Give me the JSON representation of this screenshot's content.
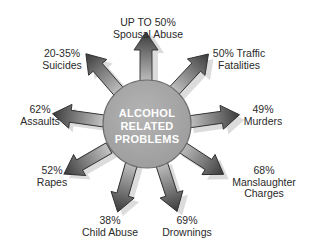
{
  "diagram": {
    "center": {
      "lines": [
        "ALCOHOL",
        "RELATED",
        "PROBLEMS"
      ],
      "fill": "#a9a9a9",
      "stroke": "#6e6e6e"
    },
    "colors": {
      "arrow_dark": "#3a3a3a",
      "arrow_light": "#b8b8b8",
      "shadow": "#d4d4d4",
      "text": "#2a2a2a"
    },
    "items": [
      {
        "value": "UP TO 50%",
        "label": "Spousal Abuse"
      },
      {
        "value": "50% Traffic",
        "label": "Fatalities"
      },
      {
        "value": "49%",
        "label": "Murders"
      },
      {
        "value": "68%",
        "label": "Manslaughter",
        "label2": "Charges"
      },
      {
        "value": "69%",
        "label": "Drownings"
      },
      {
        "value": "38%",
        "label": "Child Abuse"
      },
      {
        "value": "52%",
        "label": "Rapes"
      },
      {
        "value": "62%",
        "label": "Assaults"
      },
      {
        "value": "20-35%",
        "label": "Suicides"
      }
    ]
  }
}
